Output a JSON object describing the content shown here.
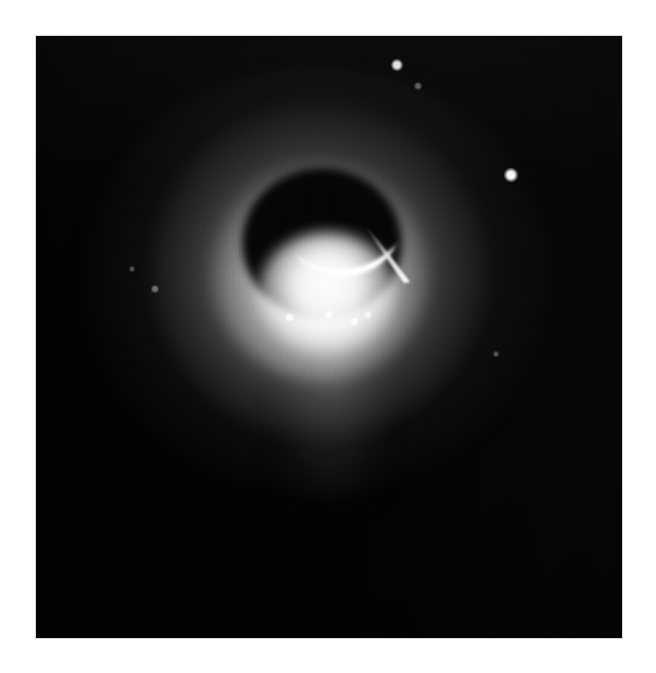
{
  "page": {
    "background_color": "#ffffff",
    "width": 656,
    "height": 673,
    "caption": ""
  },
  "plate": {
    "name": "eclipse-plate",
    "background_color": "#030303",
    "left": 36,
    "top": 36,
    "width": 586,
    "height": 602,
    "border_color": "#d8d8d8"
  },
  "scene": {
    "title": "",
    "subject": "occulted-bright-source-with-crescent-limb",
    "colors": {
      "sky": "#030303",
      "halo": "#b4b4b4",
      "core": "#ffffff",
      "occulter": "#050505",
      "crescent": "#ffffff"
    }
  },
  "features": {
    "halo": {
      "label": "diffuse-corona",
      "center_x": 281,
      "center_y": 240,
      "outer_radius_x": 235,
      "outer_radius_y": 215,
      "peak_opacity": 0.34
    },
    "core": {
      "label": "bright-core",
      "center_x": 291,
      "center_y": 250,
      "radius": 69,
      "brightness": 1.0
    },
    "occulter": {
      "label": "dark-occulting-disk",
      "center_x": 286,
      "center_y": 207,
      "radius_x": 80,
      "radius_y": 75,
      "brightness": 0.02
    },
    "crescent": {
      "label": "bright-crescent-limb",
      "opening_direction": "up-left",
      "tip_left_x": 252,
      "tip_left_y": 209,
      "tip_right_x": 356,
      "tip_right_y": 196,
      "thickness": 13
    },
    "streak": {
      "label": "prominence-streak",
      "start_x": 380,
      "start_y": 248,
      "end_x": 326,
      "end_y": 188,
      "length": 80
    },
    "plume": {
      "label": "lower-plume",
      "center_x": 296,
      "top_y": 280,
      "height": 190
    }
  },
  "point_sources": [
    {
      "name": "star-upper",
      "x": 361,
      "y": 29,
      "size": 7,
      "brightness": 0.95
    },
    {
      "name": "star-right",
      "x": 475,
      "y": 139,
      "size": 8,
      "brightness": 1.0
    },
    {
      "name": "speck-upper-faint",
      "x": 382,
      "y": 50,
      "size": 4,
      "brightness": 0.35
    },
    {
      "name": "speck-core-a",
      "x": 253,
      "y": 281,
      "size": 5,
      "brightness": 0.8
    },
    {
      "name": "speck-core-b",
      "x": 292,
      "y": 278,
      "size": 5,
      "brightness": 0.85
    },
    {
      "name": "speck-core-c",
      "x": 318,
      "y": 285,
      "size": 5,
      "brightness": 0.8
    },
    {
      "name": "speck-core-d",
      "x": 332,
      "y": 279,
      "size": 4,
      "brightness": 0.7
    },
    {
      "name": "speck-left-faint",
      "x": 119,
      "y": 253,
      "size": 4,
      "brightness": 0.4
    },
    {
      "name": "speck-mid-left",
      "x": 96,
      "y": 233,
      "size": 3,
      "brightness": 0.3
    },
    {
      "name": "speck-right-lower",
      "x": 460,
      "y": 318,
      "size": 3,
      "brightness": 0.3
    }
  ],
  "grain": {
    "label": "film-grain-texture",
    "opacity": 0.5,
    "scanlines": true
  }
}
